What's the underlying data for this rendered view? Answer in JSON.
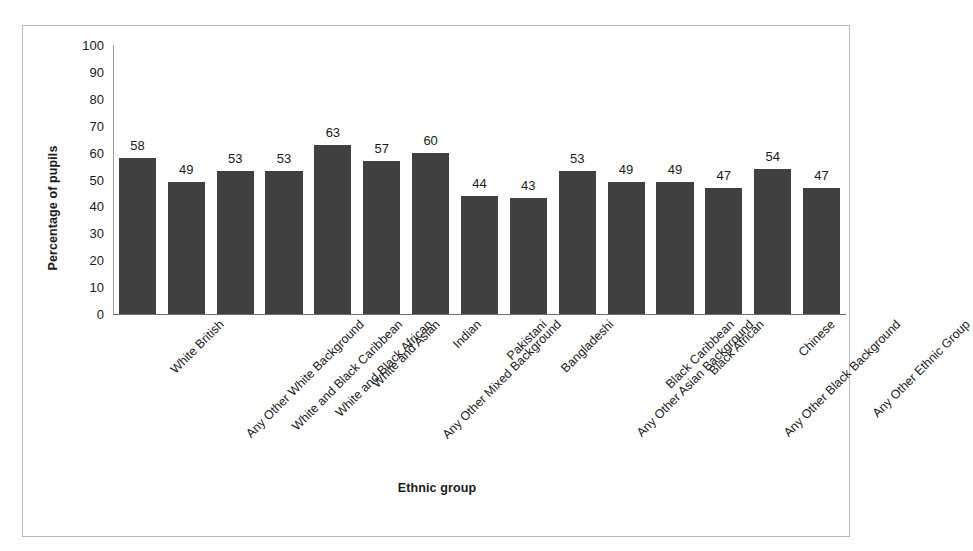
{
  "chart_data": {
    "type": "bar",
    "title": "",
    "xlabel": "Ethnic group",
    "ylabel": "Percentage of pupils",
    "ylim": [
      0,
      100
    ],
    "ytick_step": 10,
    "yticks": [
      100,
      90,
      80,
      70,
      60,
      50,
      40,
      30,
      20,
      10,
      0
    ],
    "grid": false,
    "legend": false,
    "bar_color": "#404040",
    "data_labels": true,
    "categories": [
      "White British",
      "Any Other White Background",
      "White and Black Caribbean",
      "White and Black African",
      "White and Asian",
      "Any Other Mixed Background",
      "Indian",
      "Pakistani",
      "Bangladeshi",
      "Any Other Asian Background",
      "Black Caribbean",
      "Black African",
      "Any Other Black Background",
      "Chinese",
      "Any Other Ethnic Group"
    ],
    "values": [
      58,
      49,
      53,
      53,
      63,
      57,
      60,
      44,
      43,
      53,
      49,
      49,
      47,
      54,
      47
    ]
  }
}
